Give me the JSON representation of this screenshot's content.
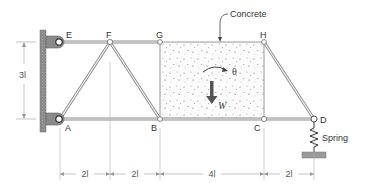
{
  "figure": {
    "type": "truss-diagram",
    "nodes": [
      {
        "id": "E",
        "label": "E"
      },
      {
        "id": "F",
        "label": "F"
      },
      {
        "id": "G",
        "label": "G"
      },
      {
        "id": "H",
        "label": "H"
      },
      {
        "id": "A",
        "label": "A"
      },
      {
        "id": "B",
        "label": "B"
      },
      {
        "id": "C",
        "label": "C"
      },
      {
        "id": "D",
        "label": "D"
      }
    ],
    "members": [
      [
        "E",
        "F"
      ],
      [
        "F",
        "G"
      ],
      [
        "A",
        "B"
      ],
      [
        "B",
        "C"
      ],
      [
        "C",
        "D"
      ],
      [
        "A",
        "F"
      ],
      [
        "F",
        "B"
      ],
      [
        "H",
        "D"
      ]
    ],
    "annotations": {
      "concrete": "Concrete",
      "rotation": "θ",
      "weight": "W",
      "spring": "Spring"
    },
    "dimensions": {
      "height": "3l",
      "spans": [
        "2l",
        "2l",
        "4l",
        "2l"
      ]
    },
    "colors": {
      "member": "#9a9a9a",
      "wall": "#8a8a8a",
      "support": "#7a7a7a",
      "arrow": "#555555",
      "dimension": "#aaaaaa"
    }
  }
}
